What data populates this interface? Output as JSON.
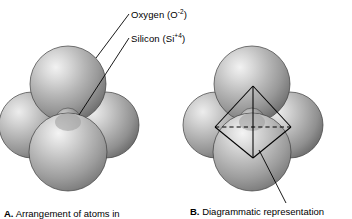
{
  "figure": {
    "title_semantic": "silica-tetrahedron-diagram",
    "background_color": "#ffffff",
    "line_color": "#000000",
    "sphere_colors": {
      "oxygen_light": "#e8e8e8",
      "oxygen_mid": "#b4b4b4",
      "oxygen_dark": "#6e6e6e",
      "oxygen_edge": "#4a4a4a",
      "silicon_light": "#c9c9c9",
      "silicon_dark": "#5a5a5a"
    }
  },
  "labels": [
    {
      "id": "oxygen",
      "name": "Oxygen",
      "open_paren": "(O",
      "charge": "-2",
      "close_paren": ")",
      "full_text": "Oxygen (O-2)"
    },
    {
      "id": "silicon",
      "name": "Silicon",
      "open_paren": "(Si",
      "charge": "+4",
      "close_paren": ")",
      "full_text": "Silicon (Si+4)"
    }
  ],
  "panels": [
    {
      "id": "a",
      "letter": "A.",
      "caption": "Arrangement of atoms in",
      "description": "space-filling model of four oxygen spheres around a central silicon ion"
    },
    {
      "id": "b",
      "letter": "B.",
      "caption": "Diagrammatic representation",
      "description": "same sphere cluster overlaid with a tetrahedron wireframe"
    }
  ],
  "geometry": {
    "panel_a": {
      "spheres": [
        {
          "name": "oxygen-back-top",
          "cx": 68,
          "cy": 84,
          "r": 38
        },
        {
          "name": "oxygen-left",
          "cx": 32,
          "cy": 125,
          "r": 33
        },
        {
          "name": "oxygen-right",
          "cx": 106,
          "cy": 125,
          "r": 33
        },
        {
          "name": "oxygen-front",
          "cx": 68,
          "cy": 152,
          "r": 39
        },
        {
          "name": "silicon-center",
          "cx": 68,
          "cy": 122,
          "r": 13
        }
      ]
    },
    "panel_b": {
      "spheres": [
        {
          "name": "oxygen-back-top",
          "cx": 252,
          "cy": 84,
          "r": 38
        },
        {
          "name": "oxygen-left",
          "cx": 216,
          "cy": 125,
          "r": 33
        },
        {
          "name": "oxygen-right",
          "cx": 290,
          "cy": 125,
          "r": 33
        },
        {
          "name": "oxygen-front",
          "cx": 252,
          "cy": 152,
          "r": 39
        },
        {
          "name": "silicon-center",
          "cx": 252,
          "cy": 122,
          "r": 13
        }
      ],
      "tetrahedron": {
        "apex_top": [
          253,
          86
        ],
        "apex_bottom": [
          253,
          158
        ],
        "left": [
          215,
          127
        ],
        "right": [
          291,
          127
        ],
        "hidden_back": [
          236,
          122
        ],
        "dashed_edge": true
      }
    },
    "leader_lines": [
      {
        "name": "oxygen-leader",
        "from": [
          129,
          14
        ],
        "to": [
          96,
          58
        ]
      },
      {
        "name": "silicon-leader",
        "from": [
          129,
          38
        ],
        "to": [
          79,
          114
        ]
      },
      {
        "name": "panel-b-leader",
        "from": [
          285,
          202
        ],
        "to": [
          259,
          150
        ]
      }
    ]
  }
}
